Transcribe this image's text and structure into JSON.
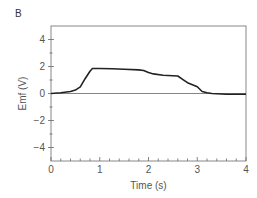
{
  "panel_label": "B",
  "chart_data": {
    "type": "line",
    "title": "",
    "xlabel": "Time (s)",
    "ylabel": "Emf (V)",
    "xlim": [
      0,
      4
    ],
    "ylim": [
      -5,
      5
    ],
    "x_ticks": [
      0,
      1,
      2,
      3,
      4
    ],
    "x_tick_labels": [
      "0",
      "1",
      "2",
      "3",
      "4"
    ],
    "x_minor_step": 0.2,
    "y_ticks": [
      -4,
      -2,
      0,
      2,
      4
    ],
    "y_tick_labels": [
      "−4",
      "−2",
      "0",
      "2",
      "4"
    ],
    "y_minor_step": 1,
    "grid": false,
    "zero_line": true,
    "legend": null,
    "series": [
      {
        "name": "Emf",
        "color": "#222222",
        "x": [
          0,
          0.2,
          0.4,
          0.5,
          0.6,
          0.7,
          0.8,
          0.85,
          1.0,
          1.25,
          1.5,
          1.8,
          1.9,
          2.0,
          2.1,
          2.3,
          2.6,
          2.7,
          2.8,
          2.9,
          3.0,
          3.1,
          3.2,
          3.3,
          3.6,
          4.0
        ],
        "y": [
          0,
          0.05,
          0.15,
          0.25,
          0.5,
          1.1,
          1.65,
          1.85,
          1.85,
          1.83,
          1.8,
          1.75,
          1.7,
          1.55,
          1.45,
          1.35,
          1.3,
          1.05,
          0.8,
          0.65,
          0.5,
          0.15,
          0.05,
          0.0,
          -0.05,
          -0.05
        ]
      }
    ]
  }
}
